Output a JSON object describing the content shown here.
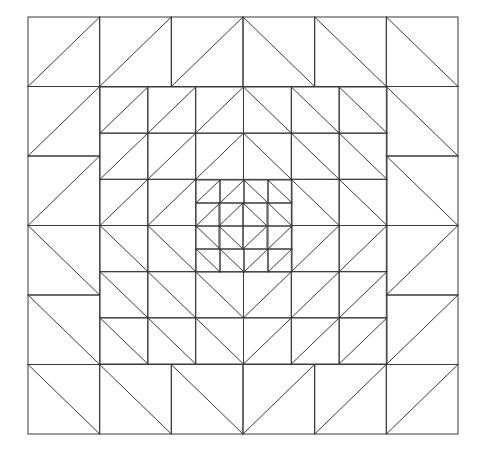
{
  "figure": {
    "title": "",
    "description": "Concentric half-square-triangle quilt pattern",
    "background": "#ffffff",
    "stroke_color": "#3a3a3a",
    "stroke_width": 1,
    "center": [
      243,
      226
    ]
  },
  "rings": [
    {
      "name": "outer-ring",
      "bounds": {
        "x0": 28,
        "y0": 17,
        "x1": 458,
        "y1": 434
      },
      "divisions": 6,
      "hole": {
        "from": 1,
        "to": 5
      }
    },
    {
      "name": "middle-ring",
      "bounds": {
        "x0": 100,
        "y0": 87,
        "x1": 387,
        "y1": 364
      },
      "divisions": 6,
      "hole": {
        "from": 2,
        "to": 4
      }
    },
    {
      "name": "inner-ring",
      "bounds": {
        "x0": 196,
        "y0": 180,
        "x1": 292,
        "y1": 272
      },
      "divisions": 4,
      "hole": {
        "from": 1,
        "to": 3
      }
    },
    {
      "name": "center-block",
      "bounds": {
        "x0": 219,
        "y0": 203,
        "x1": 267,
        "y1": 249
      },
      "divisions": 2,
      "hole": null
    }
  ],
  "diagonal_rule": {
    "top-left": "/",
    "top-right": "\\",
    "bottom-left": "\\",
    "bottom-right": "/"
  }
}
